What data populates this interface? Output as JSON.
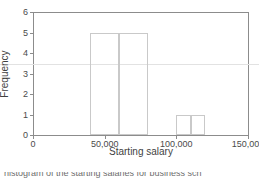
{
  "chart_data": {
    "type": "bar",
    "title": "",
    "xlabel": "Starting salary",
    "ylabel": "Frequency",
    "xlim": [
      0,
      150000
    ],
    "ylim": [
      0,
      6
    ],
    "grid": true,
    "legend": null,
    "xticks": [
      {
        "value": 0,
        "label": "0"
      },
      {
        "value": 50000,
        "label": "50,000"
      },
      {
        "value": 100000,
        "label": "100,000"
      },
      {
        "value": 150000,
        "label": "150,000"
      }
    ],
    "yticks": [
      {
        "value": 0,
        "label": "0"
      },
      {
        "value": 1,
        "label": "1"
      },
      {
        "value": 2,
        "label": "2"
      },
      {
        "value": 3,
        "label": "3"
      },
      {
        "value": 4,
        "label": "4"
      },
      {
        "value": 5,
        "label": "5"
      },
      {
        "value": 6,
        "label": "6"
      }
    ],
    "bin_width": 20000,
    "categories": [
      "40,000-60,000",
      "60,000-80,000",
      "100,000-110,000",
      "110,000-120,000"
    ],
    "values": [
      5,
      5,
      1,
      1
    ],
    "bars": [
      {
        "x0": 40000,
        "x1": 60000,
        "value": 5
      },
      {
        "x0": 60000,
        "x1": 80000,
        "value": 5
      },
      {
        "x0": 100000,
        "x1": 110000,
        "value": 1
      },
      {
        "x0": 110000,
        "x1": 120000,
        "value": 1
      }
    ],
    "gridlines": [
      3.45
    ],
    "colors": {
      "bar_edge": "#c9c9c9",
      "bar_fill": "transparent",
      "axis": "#8c8c8c",
      "grid": "#e2e2e2",
      "text": "#4a4a4a"
    }
  },
  "caption": {
    "cutoff_line": "histogram of the starting salaries for business sch"
  }
}
